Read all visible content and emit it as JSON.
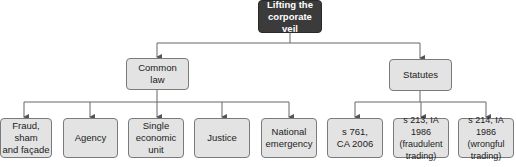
{
  "diagram": {
    "root": {
      "label": "Lifting the\ncorporate veil"
    },
    "branches": [
      {
        "label": "Common\nlaw",
        "children": [
          {
            "label": "Fraud, sham\nand façade"
          },
          {
            "label": "Agency"
          },
          {
            "label": "Single\neconomic\nunit"
          },
          {
            "label": "Justice"
          },
          {
            "label": "National\nemergency"
          }
        ]
      },
      {
        "label": "Statutes",
        "children": [
          {
            "label": "s 761,\nCA 2006"
          },
          {
            "label": "s 213, IA 1986\n(fraudulent\ntrading)"
          },
          {
            "label": "s 214, IA 1986\n(wrongful\ntrading)"
          }
        ]
      }
    ],
    "colors": {
      "root_fill": "#3b3b3b",
      "node_fill": "#e3e3e3",
      "node_border": "#7a7a7a",
      "connector": "#555555"
    }
  }
}
